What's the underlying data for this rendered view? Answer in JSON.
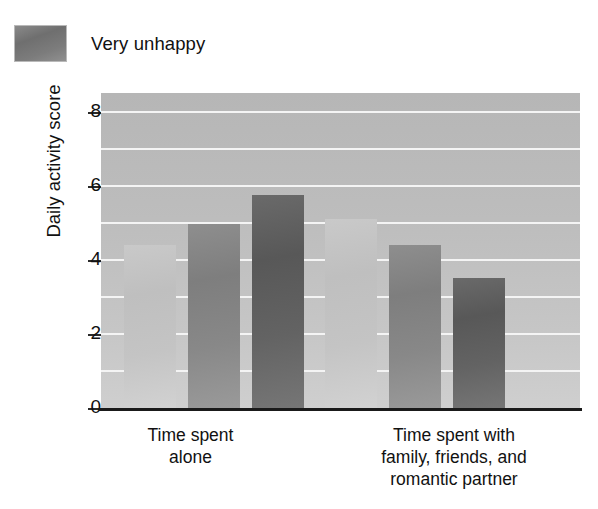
{
  "legend": {
    "label": "Very unhappy",
    "swatch_color": "#7c7c7c"
  },
  "chart_data": {
    "type": "bar",
    "title": "",
    "xlabel": "",
    "ylabel": "Daily activity score",
    "categories": [
      "Time spent alone",
      "Time spent with family, friends, and romantic partner"
    ],
    "category_lines": [
      [
        "Time spent",
        "alone"
      ],
      [
        "Time spent with",
        "family, friends, and",
        "romantic partner"
      ]
    ],
    "series": [
      {
        "name": "series-1-light",
        "color": "#c4c4c4",
        "values": [
          4.45,
          5.15
        ]
      },
      {
        "name": "series-2-medium",
        "color": "#888888",
        "values": [
          5.0,
          4.45
        ]
      },
      {
        "name": "series-3-dark",
        "color": "#636363",
        "values": [
          5.8,
          3.55
        ]
      }
    ],
    "ylim": [
      0,
      8.55
    ],
    "yticks": [
      0,
      2,
      4,
      6,
      8
    ],
    "ytick_labels": [
      "0",
      "2",
      "4",
      "6",
      "8"
    ],
    "gridlines": [
      1,
      2,
      3,
      4,
      5,
      6,
      7,
      8
    ],
    "grid": true,
    "grid_color": "#f4f4f4",
    "plot_background": "#c0c0c0",
    "legend_position": "above-left"
  }
}
